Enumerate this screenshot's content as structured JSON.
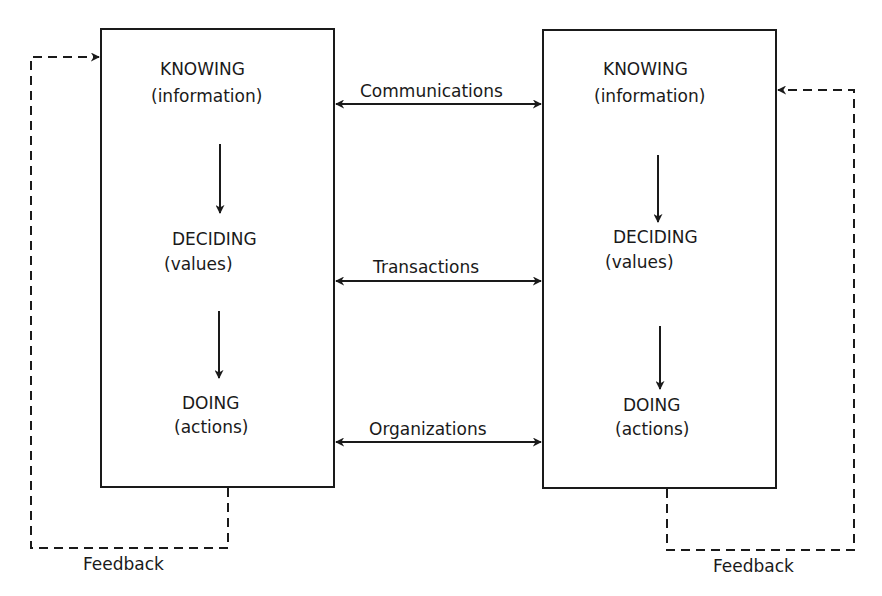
{
  "diagram": {
    "left_agent": {
      "knowing": "KNOWING",
      "knowing_sub": "(information)",
      "deciding": "DECIDING",
      "deciding_sub": "(values)",
      "doing": "DOING",
      "doing_sub": "(actions)",
      "feedback": "Feedback"
    },
    "right_agent": {
      "knowing": "KNOWING",
      "knowing_sub": "(information)",
      "deciding": "DECIDING",
      "deciding_sub": "(values)",
      "doing": "DOING",
      "doing_sub": "(actions)",
      "feedback": "Feedback"
    },
    "links": {
      "communications": "Communications",
      "transactions": "Transactions",
      "organizations": "Organizations"
    },
    "colors": {
      "stroke": "#1a1a1a",
      "background": "#ffffff"
    }
  }
}
